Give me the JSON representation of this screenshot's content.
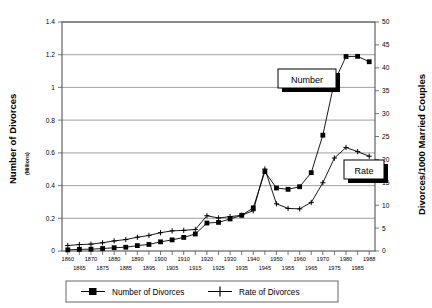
{
  "chart_data": {
    "type": "line",
    "title": "",
    "xlabel": "",
    "x": [
      1860,
      1865,
      1870,
      1875,
      1880,
      1885,
      1890,
      1895,
      1900,
      1905,
      1910,
      1915,
      1920,
      1925,
      1930,
      1935,
      1940,
      1946,
      1950,
      1955,
      1960,
      1965,
      1970,
      1975,
      1980,
      1985,
      1988
    ],
    "xticklabels": [
      "1860",
      "1865",
      "1870",
      "1875",
      "1880",
      "1885",
      "1890",
      "1895",
      "1900",
      "1905",
      "1910",
      "1915",
      "1920",
      "1925",
      "1930",
      "1935",
      "1940",
      "1945",
      "1950",
      "1955",
      "1960",
      "1965",
      "1970",
      "1975",
      "1980",
      "1985",
      "1988"
    ],
    "xticks_row_top": [
      "1860",
      "1870",
      "1880",
      "1890",
      "1900",
      "1910",
      "1920",
      "1930",
      "1940",
      "1950",
      "1960",
      "1970",
      "1980",
      "1988"
    ],
    "xticks_row_bottom": [
      "1865",
      "1875",
      "1885",
      "1895",
      "1905",
      "1915",
      "1925",
      "1935",
      "1945",
      "1955",
      "1965",
      "1975",
      "1985"
    ],
    "grid": true,
    "legend_position": "bottom",
    "axes": {
      "left": {
        "label": "Number of Divorces",
        "sublabel": "(Millions)",
        "ylim": [
          0,
          1.4
        ],
        "ticks": [
          0,
          0.2,
          0.4,
          0.6,
          0.8,
          1,
          1.2,
          1.4
        ],
        "ticklabels": [
          "0",
          "0.2",
          "0.4",
          "0.6",
          "0.8",
          "1",
          "1.2",
          "1.4"
        ]
      },
      "right": {
        "label": "Divorces/1000 Married Couples",
        "ylim": [
          0,
          50
        ],
        "ticks": [
          0,
          5,
          10,
          15,
          20,
          25,
          30,
          35,
          40,
          45,
          50
        ],
        "ticklabels": [
          "0",
          "5",
          "10",
          "15",
          "20",
          "25",
          "30",
          "35",
          "40",
          "45",
          "50"
        ]
      }
    },
    "series": [
      {
        "name": "Number of Divorces",
        "axis": "left",
        "marker": "filled-square",
        "values": [
          0.007,
          0.01,
          0.011,
          0.015,
          0.02,
          0.023,
          0.033,
          0.04,
          0.056,
          0.068,
          0.083,
          0.104,
          0.171,
          0.175,
          0.196,
          0.218,
          0.264,
          0.485,
          0.385,
          0.377,
          0.393,
          0.479,
          0.708,
          1.036,
          1.189,
          1.19,
          1.157
        ]
      },
      {
        "name": "Rate of Divorces",
        "axis": "right",
        "marker": "plus",
        "values": [
          1.2,
          1.4,
          1.5,
          1.8,
          2.2,
          2.5,
          3.0,
          3.4,
          4.0,
          4.4,
          4.5,
          4.7,
          7.7,
          7.2,
          7.5,
          7.8,
          8.8,
          17.9,
          10.3,
          9.3,
          9.2,
          10.6,
          14.9,
          20.3,
          22.6,
          21.7,
          20.7
        ]
      }
    ],
    "annotations": [
      {
        "text": "Number",
        "target_series": "Number of Divorces"
      },
      {
        "text": "Rate",
        "target_series": "Rate of Divorces"
      }
    ]
  },
  "legend": {
    "entries": [
      {
        "label": "Number of Divorces",
        "marker": "filled-square"
      },
      {
        "label": "Rate of Divorces",
        "marker": "plus"
      }
    ]
  }
}
